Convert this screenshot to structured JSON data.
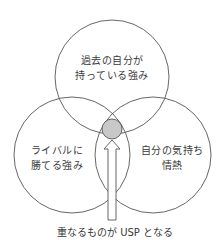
{
  "diagram": {
    "type": "venn",
    "circles": [
      {
        "id": "top",
        "line1": "過去の自分が",
        "line2": "持っている強み",
        "cx": 112,
        "cy": 77,
        "r": 57
      },
      {
        "id": "left",
        "line1": "ライバルに",
        "line2": "勝てる強み",
        "cx": 72,
        "cy": 155,
        "r": 58
      },
      {
        "id": "right",
        "line1": "自分の気持ち",
        "line2": "情熱",
        "cx": 153,
        "cy": 155,
        "r": 58
      }
    ],
    "intersection": {
      "cx": 112,
      "cy": 129,
      "r": 10,
      "fill": "#c8c8c8"
    },
    "caption": "重なるものが USP となる",
    "colors": {
      "stroke": "#555555",
      "fill_intersection": "#c8c8c8",
      "text": "#3a3a3a"
    }
  }
}
